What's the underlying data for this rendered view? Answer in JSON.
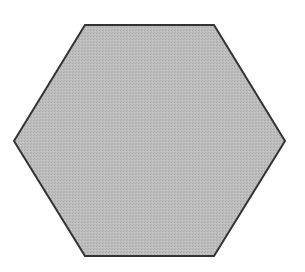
{
  "diagram": {
    "shape": "hexagon",
    "orientation": "flat-top",
    "vertices": [
      [
        85,
        25
      ],
      [
        214,
        25
      ],
      [
        285,
        141
      ],
      [
        214,
        256
      ],
      [
        85,
        256
      ],
      [
        14,
        141
      ]
    ],
    "fill_color": "#b9b9b9",
    "stroke_color": "#333333",
    "stroke_width": 2,
    "background_color": "#ffffff"
  }
}
